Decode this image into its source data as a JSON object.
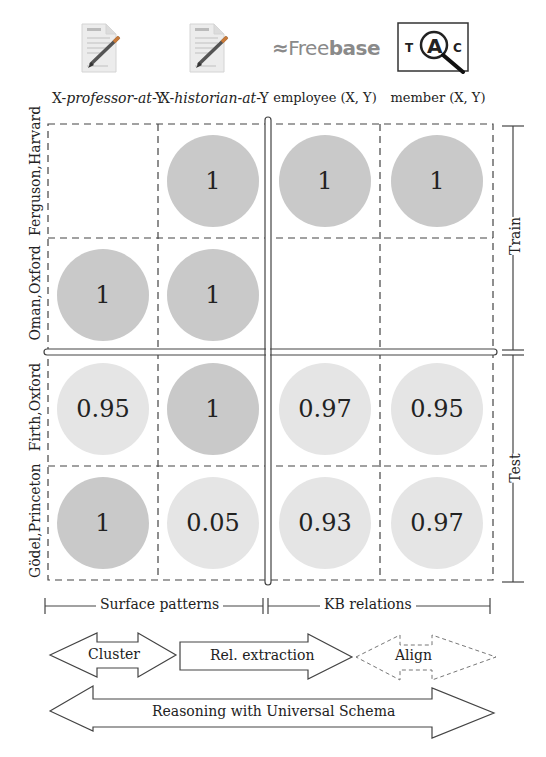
{
  "columns": {
    "c1": {
      "pre": "X-",
      "italic": "professor-at",
      "post": "-Y",
      "icon": "document-pen-icon"
    },
    "c2": {
      "pre": "X-",
      "italic": "historian-at",
      "post": "-Y",
      "icon": "document-pen-icon"
    },
    "c3": {
      "label": "employee (X, Y)",
      "icon": "freebase-logo"
    },
    "c4": {
      "label": "member (X, Y)",
      "icon": "tac-magnifier-icon"
    }
  },
  "freebase": {
    "light": "Free",
    "bold": "base",
    "glyph": "≈"
  },
  "tac": {
    "t": "T",
    "a": "A",
    "c": "C"
  },
  "rows": [
    {
      "label": "Ferguson,Harvard",
      "values": [
        "",
        "1",
        "1",
        "1"
      ],
      "shades": [
        "none",
        "dark",
        "dark",
        "dark"
      ]
    },
    {
      "label": "Oman,Oxford",
      "values": [
        "1",
        "1",
        "",
        ""
      ],
      "shades": [
        "dark",
        "dark",
        "none",
        "none"
      ]
    },
    {
      "label": "Firth,Oxford",
      "values": [
        "0.95",
        "1",
        "0.97",
        "0.95"
      ],
      "shades": [
        "light",
        "dark",
        "light",
        "light"
      ]
    },
    {
      "label": "Gödel,Princeton",
      "values": [
        "1",
        "0.05",
        "0.93",
        "0.97"
      ],
      "shades": [
        "dark",
        "light",
        "light",
        "light"
      ]
    }
  ],
  "side": {
    "train": "Train",
    "test": "Test"
  },
  "groups": {
    "surface": "Surface patterns",
    "kb": "KB relations"
  },
  "arrows": {
    "cluster": "Cluster",
    "rel_extraction": "Rel. extraction",
    "align": "Align",
    "universal": "Reasoning with Universal Schema"
  },
  "colors": {
    "dark_circle": "#c9c9c9",
    "light_circle": "#e5e5e5",
    "line": "#444444"
  }
}
